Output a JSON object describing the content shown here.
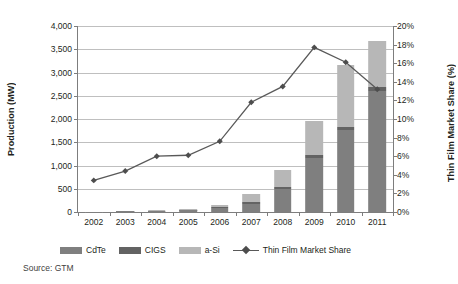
{
  "chart_data": {
    "type": "bar",
    "title": "",
    "xlabel": "",
    "ylabel": "Production (MW)",
    "y2label": "Thin Film Market Share (%)",
    "categories": [
      "2002",
      "2003",
      "2004",
      "2005",
      "2006",
      "2007",
      "2008",
      "2009",
      "2010",
      "2011"
    ],
    "ylim": [
      0,
      4000
    ],
    "yticks": [
      0,
      500,
      1000,
      1500,
      2000,
      2500,
      3000,
      3500,
      4000
    ],
    "yticklabels": [
      "0",
      "500",
      "1,000",
      "1,500",
      "2,000",
      "2,500",
      "3,000",
      "3,500",
      "4,000"
    ],
    "y2lim": [
      0,
      20
    ],
    "y2ticks": [
      0,
      2,
      4,
      6,
      8,
      10,
      12,
      14,
      16,
      18,
      20
    ],
    "y2ticklabels": [
      "0%",
      "2%",
      "4%",
      "6%",
      "8%",
      "10%",
      "12%",
      "14%",
      "16%",
      "18%",
      "20%"
    ],
    "grid": true,
    "stacked": true,
    "legend_position": "bottom",
    "series": [
      {
        "name": "CdTe",
        "axis": "left",
        "color": "#7f7f7f",
        "values": [
          6,
          14,
          26,
          40,
          85,
          180,
          500,
          1165,
          1755,
          2600
        ]
      },
      {
        "name": "CIGS",
        "axis": "left",
        "color": "#636363",
        "values": [
          1,
          3,
          5,
          8,
          16,
          28,
          45,
          60,
          70,
          90
        ]
      },
      {
        "name": "a-Si",
        "axis": "left",
        "color": "#b7b7b7",
        "values": [
          4,
          9,
          16,
          25,
          50,
          180,
          355,
          725,
          1335,
          980
        ]
      },
      {
        "name": "Thin Film Market Share",
        "axis": "right",
        "type": "line",
        "color": "#595959",
        "values": [
          3.4,
          4.4,
          6.0,
          6.1,
          7.6,
          11.8,
          13.5,
          17.7,
          16.1,
          13.2
        ]
      }
    ],
    "totals": [
      11,
      26,
      47,
      73,
      151,
      388,
      900,
      1950,
      3160,
      3670
    ]
  },
  "legend": {
    "items": [
      {
        "label": "CdTe",
        "kind": "swatch"
      },
      {
        "label": "CIGS",
        "kind": "swatch"
      },
      {
        "label": "a-Si",
        "kind": "swatch"
      },
      {
        "label": "Thin Film Market Share",
        "kind": "line"
      }
    ]
  },
  "source": {
    "text": "Source: GTM"
  }
}
